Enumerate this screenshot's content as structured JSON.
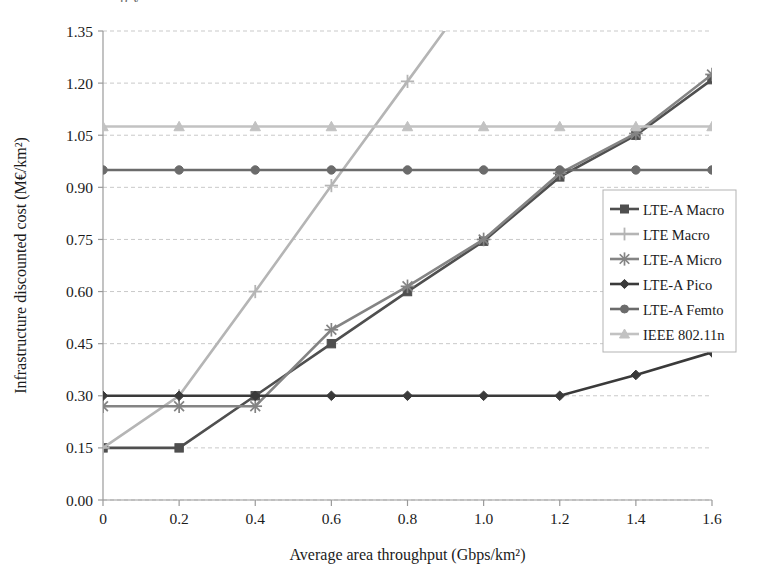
{
  "figure": {
    "partial_top_text": "p y",
    "background_color": "#ffffff"
  },
  "axes": {
    "x_title": "Average area throughput (Gbps/km²)",
    "y_title": "Infrastructure discounted cost (M€/km²)",
    "x_ticks": [
      "0",
      "0.2",
      "0.4",
      "0.6",
      "0.8",
      "1.0",
      "1.2",
      "1.4",
      "1.6"
    ],
    "y_ticks": [
      "0.00",
      "0.15",
      "0.30",
      "0.45",
      "0.60",
      "0.75",
      "0.90",
      "1.05",
      "1.20",
      "1.35"
    ],
    "grid": "horizontal-dashed"
  },
  "legend": {
    "position": "inside-right",
    "items": [
      {
        "label": "LTE-A Macro",
        "marker": "square-marker",
        "color": "#4f4f4f"
      },
      {
        "label": "LTE Macro",
        "marker": "plus-marker",
        "color": "#b5b5b5"
      },
      {
        "label": "LTE-A Micro",
        "marker": "asterisk-marker",
        "color": "#848484"
      },
      {
        "label": "LTE-A Pico",
        "marker": "diamond-marker",
        "color": "#3a3a3a"
      },
      {
        "label": "LTE-A Femto",
        "marker": "circle-marker",
        "color": "#6b6b6b"
      },
      {
        "label": "IEEE 802.11n",
        "marker": "triangle-marker",
        "color": "#c2c2c2"
      }
    ]
  },
  "chart_data": {
    "type": "line",
    "title": "",
    "xlabel": "Average area throughput (Gbps/km²)",
    "ylabel": "Infrastructure discounted cost (M€/km²)",
    "xlim": [
      0,
      1.6
    ],
    "ylim": [
      0.0,
      1.35
    ],
    "xticks": [
      0,
      0.2,
      0.4,
      0.6,
      0.8,
      1.0,
      1.2,
      1.4,
      1.6
    ],
    "yticks": [
      0.0,
      0.15,
      0.3,
      0.45,
      0.6,
      0.75,
      0.9,
      1.05,
      1.2,
      1.35
    ],
    "grid": true,
    "legend_position": "right-inside",
    "x": [
      0,
      0.2,
      0.4,
      0.6,
      0.8,
      1.0,
      1.2,
      1.4,
      1.6
    ],
    "series": [
      {
        "name": "LTE-A Macro",
        "marker": "square",
        "color": "#4f4f4f",
        "values": [
          0.15,
          0.15,
          0.3,
          0.45,
          0.6,
          0.745,
          0.93,
          1.05,
          1.21
        ]
      },
      {
        "name": "LTE Macro",
        "marker": "plus",
        "color": "#b5b5b5",
        "values": [
          0.15,
          0.3,
          0.6,
          0.905,
          1.205,
          null,
          null,
          null,
          null
        ],
        "note": "rises off the top of the plot beyond x=0.8; drawn clipped at y=1.35 near x=0.9"
      },
      {
        "name": "LTE-A Micro",
        "marker": "asterisk",
        "color": "#848484",
        "values": [
          0.27,
          0.27,
          0.27,
          0.49,
          0.615,
          0.75,
          0.94,
          1.055,
          1.225
        ]
      },
      {
        "name": "LTE-A Pico",
        "marker": "diamond",
        "color": "#3a3a3a",
        "values": [
          0.3,
          0.3,
          0.3,
          0.3,
          0.3,
          0.3,
          0.3,
          0.36,
          0.425
        ]
      },
      {
        "name": "LTE-A Femto",
        "marker": "circle",
        "color": "#6b6b6b",
        "values": [
          0.95,
          0.95,
          0.95,
          0.95,
          0.95,
          0.95,
          0.95,
          0.95,
          0.95
        ]
      },
      {
        "name": "IEEE 802.11n",
        "marker": "triangle",
        "color": "#c2c2c2",
        "values": [
          1.075,
          1.075,
          1.075,
          1.075,
          1.075,
          1.075,
          1.075,
          1.075,
          1.075
        ]
      }
    ]
  }
}
